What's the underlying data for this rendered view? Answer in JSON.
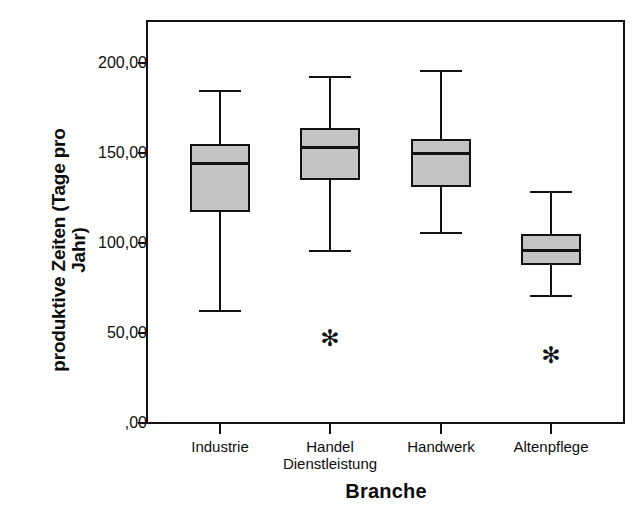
{
  "chart_data": {
    "type": "box",
    "title": "",
    "xlabel": "Branche",
    "ylabel": "produktive Zeiten (Tage pro\nJahr)",
    "ylim": [
      0,
      215
    ],
    "ytick_values": [
      200,
      150,
      100,
      50,
      0
    ],
    "ytick_labels": [
      "200,00",
      "150,00",
      "100,00",
      "50,00",
      ",00"
    ],
    "grid": false,
    "legend": null,
    "categories": [
      "Industrie",
      "Handel\nDienstleistung",
      "Handwerk",
      "Altenpflege"
    ],
    "boxes": [
      {
        "category": "Industrie",
        "whisker_low": 63,
        "q1": 117,
        "median": 144,
        "q3": 155,
        "whisker_high": 185,
        "outliers": []
      },
      {
        "category": "Handel Dienstleistung",
        "whisker_low": 96,
        "q1": 135,
        "median": 153,
        "q3": 164,
        "whisker_high": 193,
        "outliers": [
          47
        ]
      },
      {
        "category": "Handwerk",
        "whisker_low": 106,
        "q1": 131,
        "median": 150,
        "q3": 158,
        "whisker_high": 196,
        "outliers": []
      },
      {
        "category": "Altenpflege",
        "whisker_low": 71,
        "q1": 88,
        "median": 96,
        "q3": 105,
        "whisker_high": 129,
        "outliers": [
          38
        ]
      }
    ],
    "colors": {
      "box_fill": "#c4c4c4",
      "line": "#121212",
      "background": "#ffffff"
    },
    "outlier_marker": "✻"
  }
}
